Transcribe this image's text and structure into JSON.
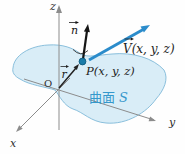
{
  "figure": {
    "background": "#fefefe",
    "axes": {
      "x_label": "x",
      "y_label": "y",
      "z_label": "z",
      "origin_label": "O",
      "line_color": "#8c8c8c",
      "label_color": "#2e2e2e"
    },
    "surface": {
      "label_cjk": "曲面",
      "label_s": "S",
      "fill": "#d9edf7",
      "outline": "#7fb9d8",
      "label_color": "#3598cc"
    },
    "point": {
      "label": "P(x, y, z)",
      "dot_fill": "#1a7ca9",
      "dot_stroke": "#0d5a7e",
      "label_color": "#1d1d1d"
    },
    "vectors": {
      "n": {
        "label": "n",
        "arrow_mark": "→",
        "color": "#151515"
      },
      "r": {
        "label": "r",
        "arrow_mark": "→",
        "color": "#222222"
      },
      "v": {
        "label": "V(x, y, z)",
        "arrow_mark": "→",
        "color": "#2b8ccb"
      }
    }
  }
}
